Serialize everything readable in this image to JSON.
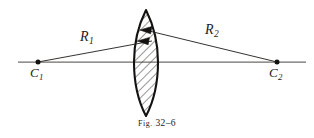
{
  "figure": {
    "caption_prefix": "Fig.",
    "caption_number": "32–6",
    "caption_full": "Fig. 32–6",
    "background_color": "#ffffff",
    "ink_color": "#1e1c1b",
    "axis_color": "#6f6d6b"
  },
  "labels": {
    "radius_1": {
      "base": "R",
      "subscript": "1"
    },
    "radius_2": {
      "base": "R",
      "subscript": "2"
    },
    "center_1": {
      "base": "C",
      "subscript": "1"
    },
    "center_2": {
      "base": "C",
      "subscript": "2"
    }
  },
  "geometry": {
    "optical_axis": {
      "x1": 18,
      "y1": 62,
      "x2": 306,
      "y2": 62
    },
    "center_point_1": {
      "x": 38,
      "y": 62
    },
    "center_point_2": {
      "x": 277,
      "y": 62
    },
    "lens": {
      "type": "biconvex",
      "center_x": 146,
      "top_apex_y": 10,
      "bottom_apex_y": 116,
      "half_width": 12,
      "hatch_angle_deg": 45
    },
    "radius_line_1": {
      "from_x": 38,
      "from_y": 62,
      "to_x": 150,
      "to_y": 41
    },
    "radius_line_2": {
      "from_x": 277,
      "from_y": 62,
      "to_x": 143,
      "to_y": 30
    },
    "arrowheads": [
      {
        "x": 143,
        "y": 30,
        "direction": "left"
      },
      {
        "x": 150,
        "y": 41,
        "direction": "left"
      }
    ]
  }
}
